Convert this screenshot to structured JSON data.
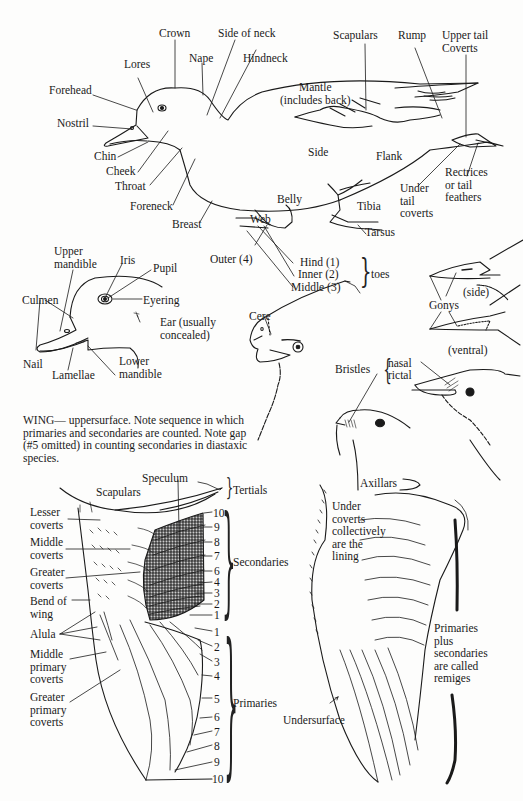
{
  "duck": {
    "labels": {
      "crown": "Crown",
      "side_of_neck": "Side of neck",
      "nape": "Nape",
      "hindneck": "Hindneck",
      "lores": "Lores",
      "forehead": "Forehead",
      "nostril": "Nostril",
      "chin": "Chin",
      "cheek": "Cheek",
      "throat": "Throat",
      "foreneck": "Foreneck",
      "breast": "Breast",
      "scapulars": "Scapulars",
      "rump": "Rump",
      "upper_tail_coverts": "Upper tail\nCoverts",
      "mantle": "Mantle\n(includes back)",
      "side": "Side",
      "flank": "Flank",
      "rectrices": "Rectrices\nor tail\nfeathers",
      "under_tail_coverts": "Under\ntail\ncoverts",
      "belly": "Belly",
      "tibia": "Tibia",
      "tarsus": "Tarsus",
      "web": "Web",
      "outer_toe": "Outer  (4)",
      "hind_toe": "Hind (1)",
      "inner_toe": "Inner (2)",
      "middle_toe": "Middle (3)",
      "toes": "toes"
    }
  },
  "duck_head": {
    "labels": {
      "upper_mandible": "Upper\nmandible",
      "iris": "Iris",
      "pupil": "Pupil",
      "culmen": "Culmen",
      "eyering": "Eyering",
      "ear": "Ear (usually\nconcealed)",
      "nail": "Nail",
      "lamellae": "Lamellae",
      "lower_mandible": "Lower\nmandible"
    }
  },
  "hawk_head": {
    "labels": {
      "cere": "Cere"
    }
  },
  "bill_detail": {
    "labels": {
      "gonys": "Gonys",
      "side": "(side)",
      "ventral": "(ventral)"
    }
  },
  "bristles": {
    "labels": {
      "bristles": "Bristles",
      "nasal": "nasal",
      "rictal": "rictal"
    }
  },
  "wing_caption": "WING— uppersurface. Note sequence in which primaries and secondaries are counted. Note gap (#5 omitted) in counting secondaries in diastaxic species.",
  "upper_wing": {
    "labels": {
      "speculum": "Speculum",
      "tertials": "Tertials",
      "scapulars": "Scapulars",
      "lesser_coverts": "Lesser\ncoverts",
      "middle_coverts": "Middle\ncoverts",
      "greater_coverts": "Greater\ncoverts",
      "bend_of_wing": "Bend of\nwing",
      "alula": "Alula",
      "middle_primary_coverts": "Middle\nprimary\ncoverts",
      "greater_primary_coverts": "Greater\nprimary\ncoverts",
      "secondaries": "Secondaries",
      "primaries": "Primaries"
    },
    "secondary_numbers": [
      "10",
      "9",
      "8",
      "7",
      "6",
      "4",
      "3",
      "2",
      "1"
    ],
    "primary_numbers": [
      "1",
      "2",
      "3",
      "4",
      "5",
      "6",
      "7",
      "8",
      "9",
      "10"
    ]
  },
  "under_wing": {
    "labels": {
      "axillars": "Axillars",
      "under_coverts": "Under\ncoverts\ncollectively\nare the\nlining",
      "remiges_note": "Primaries\nplus\nsecondaries\nare called\nremiges",
      "undersurface": "Undersurface"
    }
  },
  "colors": {
    "ink": "#1a1a1a",
    "paper": "#fdfdfc",
    "speculum_fill": "#c8c8c8"
  }
}
